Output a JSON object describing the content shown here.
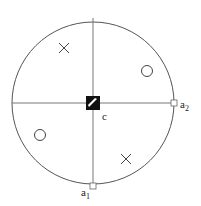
{
  "diagram": {
    "center_label": "c",
    "labels": [
      {
        "id": "a1",
        "text": "a",
        "sub": "1"
      },
      {
        "id": "a2",
        "text": "a",
        "sub": "2"
      }
    ],
    "markers": [
      {
        "type": "cross",
        "quadrant": "top-left"
      },
      {
        "type": "circle",
        "quadrant": "top-right"
      },
      {
        "type": "circle",
        "quadrant": "bottom-left"
      },
      {
        "type": "cross",
        "quadrant": "bottom-right"
      }
    ],
    "colors": {
      "stroke": "#555555",
      "center_fill": "#111111"
    }
  }
}
